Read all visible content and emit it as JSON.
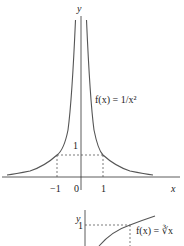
{
  "graph1": {
    "function_label": "f(x) = 1/x²",
    "x_axis_label": "x",
    "y_axis_label": "y",
    "ticks": {
      "neg_one": "−1",
      "zero": "0",
      "one": "1",
      "y_one": "1"
    }
  },
  "graph2": {
    "function_label": "f(x) = ∛x",
    "y_axis_label": "y",
    "y_one": "1"
  },
  "colors": {
    "curve": "#555555",
    "axis": "#333333",
    "dashed": "#444444"
  }
}
